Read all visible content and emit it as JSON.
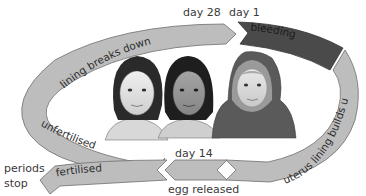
{
  "diagram": {
    "markers": {
      "day28": "day 28",
      "day1": "day 1",
      "day14": "day 14"
    },
    "stages": {
      "lining_breaks_down": "lining breaks down",
      "bleeding": "bleeding",
      "uterus_lining_builds_up": "uterus lining builds up",
      "unfertilised": "unfertilised",
      "fertilised": "fertilised"
    },
    "outside_labels": {
      "periods_stop_line1": "periods",
      "periods_stop_line2": "stop",
      "egg_released": "egg released"
    },
    "people": [
      {
        "name": "girl-left-portrait"
      },
      {
        "name": "girl-middle-portrait"
      },
      {
        "name": "girl-hijab-portrait"
      }
    ],
    "colors": {
      "arrow_light": "#bdbdbd",
      "arrow_dark": "#4a4a4a",
      "outline": "#6e6e6e",
      "text": "#3a3a3a"
    }
  }
}
